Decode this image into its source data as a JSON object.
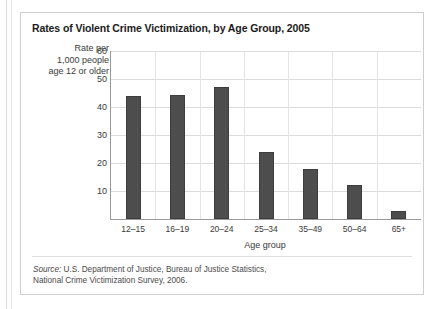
{
  "chart_data": {
    "type": "bar",
    "title": "Rates of Violent Crime Victimization, by Age Group, 2005",
    "xlabel": "Age group",
    "ylabel": "Rate per\n1,000 people\nage 12 or older",
    "categories": [
      "12–15",
      "16–19",
      "20–24",
      "25–34",
      "35–49",
      "50–64",
      "65+"
    ],
    "values": [
      44,
      44.3,
      47,
      24,
      18,
      12,
      3
    ],
    "ylim": [
      0,
      60
    ],
    "yticks": [
      10,
      20,
      30,
      40,
      50,
      60
    ],
    "grid": true,
    "legend": "none",
    "bar_color": "#4d4d4d",
    "gridline_color": "#dcdcdc",
    "axis_color": "#9a9a9a"
  },
  "source": {
    "label": "Source:",
    "line1": " U.S. Department of Justice, Bureau of Justice Statistics,",
    "line2": "National Crime Victimization Survey, 2006."
  }
}
